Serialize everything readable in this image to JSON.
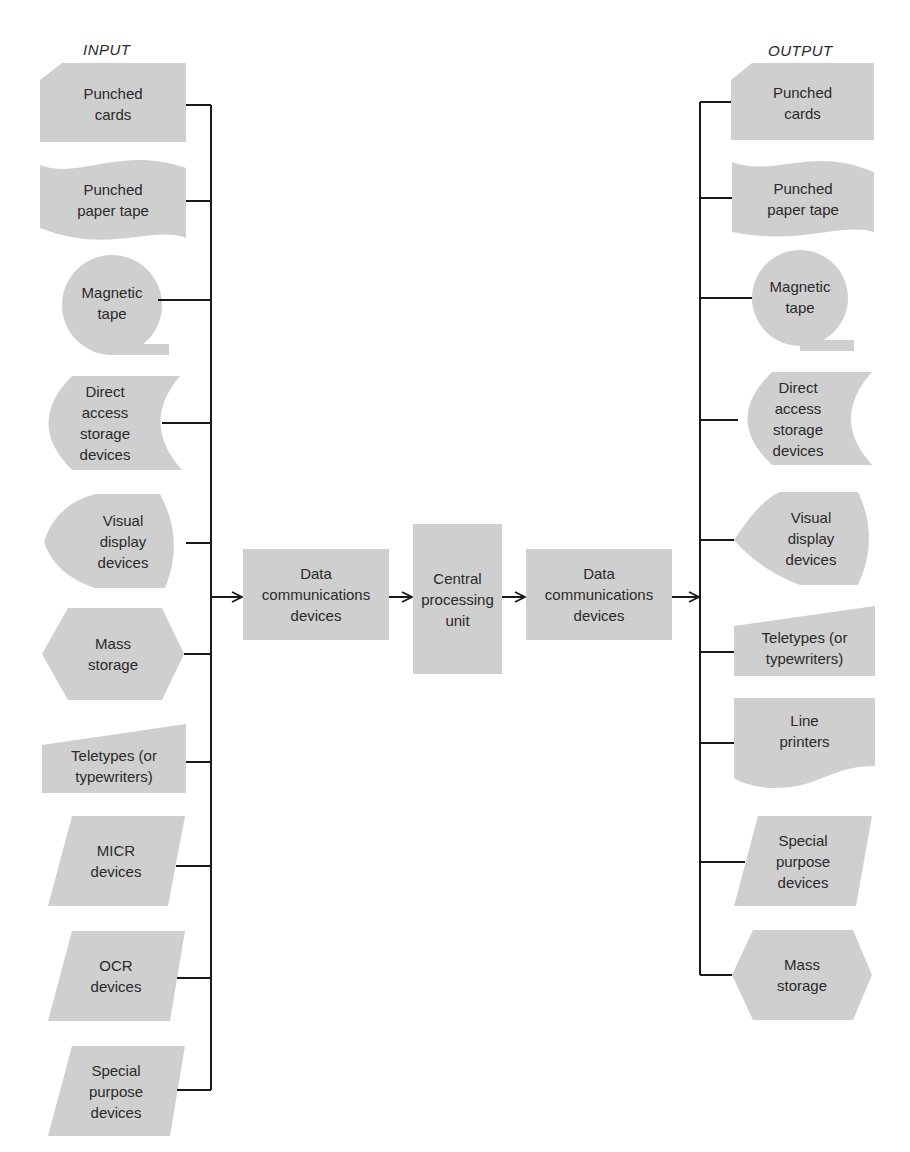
{
  "input": {
    "heading": "INPUT",
    "items": [
      {
        "label": "Punched\ncards",
        "shape": "punched-card"
      },
      {
        "label": "Punched\npaper tape",
        "shape": "paper-tape"
      },
      {
        "label": "Magnetic\ntape",
        "shape": "magnetic-tape"
      },
      {
        "label": "Direct\naccess\nstorage\ndevices",
        "shape": "direct-access-storage"
      },
      {
        "label": "Visual\ndisplay\ndevices",
        "shape": "display"
      },
      {
        "label": "Mass\nstorage",
        "shape": "hexagon"
      },
      {
        "label": "Teletypes (or\ntypewriters)",
        "shape": "manual-input"
      },
      {
        "label": "MICR\ndevices",
        "shape": "parallelogram"
      },
      {
        "label": "OCR\ndevices",
        "shape": "parallelogram"
      },
      {
        "label": "Special\npurpose\ndevices",
        "shape": "parallelogram"
      }
    ]
  },
  "center": {
    "left_comm": "Data\ncommunications\ndevices",
    "cpu": "Central\nprocessing\nunit",
    "right_comm": "Data\ncommunications\ndevices"
  },
  "output": {
    "heading": "OUTPUT",
    "items": [
      {
        "label": "Punched\ncards",
        "shape": "punched-card"
      },
      {
        "label": "Punched\npaper tape",
        "shape": "paper-tape"
      },
      {
        "label": "Magnetic\ntape",
        "shape": "magnetic-tape"
      },
      {
        "label": "Direct\naccess\nstorage\ndevices",
        "shape": "direct-access-storage"
      },
      {
        "label": "Visual\ndisplay\ndevices",
        "shape": "display"
      },
      {
        "label": "Teletypes (or\ntypewriters)",
        "shape": "manual-input"
      },
      {
        "label": "Line\nprinters",
        "shape": "document"
      },
      {
        "label": "Special\npurpose\ndevices",
        "shape": "parallelogram"
      },
      {
        "label": "Mass\nstorage",
        "shape": "hexagon"
      }
    ]
  },
  "colors": {
    "shape_fill": "#cfcfcf",
    "line": "#1a1a1a",
    "text": "#2a2a2a",
    "background": "#ffffff"
  }
}
